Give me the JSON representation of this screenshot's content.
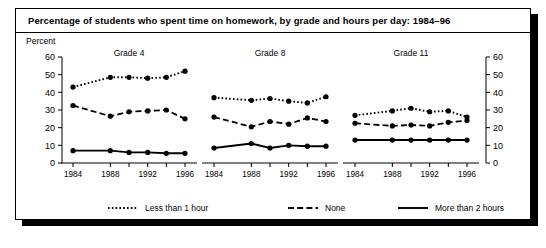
{
  "title": "Percentage of students who spent time on homework, by grade and hours per day: 1984–96",
  "axis_label": "Percent",
  "chart_data": {
    "type": "line",
    "title": "Percentage of students who spent time on homework, by grade and hours per day: 1984–96",
    "ylabel": "Percent",
    "xlabel": "",
    "ylim": [
      0,
      60
    ],
    "yticks": [
      0,
      10,
      20,
      30,
      40,
      50,
      60
    ],
    "grid": false,
    "legend_position": "bottom",
    "x": [
      1984,
      1988,
      1990,
      1992,
      1994,
      1996
    ],
    "xtick_labels": [
      "1984",
      "1988",
      "1992",
      "1996"
    ],
    "xticks_shown": [
      1984,
      1988,
      1992,
      1996
    ],
    "panels": [
      {
        "name": "Grade 4",
        "series": [
          {
            "name": "Less than 1 hour",
            "style": "dotted",
            "values": [
              43,
              48.5,
              48.5,
              48,
              48.5,
              52
            ]
          },
          {
            "name": "None",
            "style": "dashed",
            "values": [
              32.5,
              26.5,
              29,
              29.5,
              30,
              25
            ]
          },
          {
            "name": "More than 2 hours",
            "style": "solid",
            "values": [
              7,
              7,
              6,
              6,
              5.5,
              5.5
            ]
          }
        ]
      },
      {
        "name": "Grade 8",
        "series": [
          {
            "name": "Less than 1 hour",
            "style": "dotted",
            "values": [
              37,
              35.5,
              36.5,
              35,
              34,
              37.5
            ]
          },
          {
            "name": "None",
            "style": "dashed",
            "values": [
              26,
              20.5,
              23.5,
              22,
              25.5,
              23.5
            ]
          },
          {
            "name": "More than 2 hours",
            "style": "solid",
            "values": [
              8.5,
              11,
              8.5,
              10,
              9.5,
              9.5
            ]
          }
        ]
      },
      {
        "name": "Grade 11",
        "series": [
          {
            "name": "Less than 1 hour",
            "style": "dotted",
            "values": [
              27,
              29.5,
              31,
              29,
              29.5,
              26
            ]
          },
          {
            "name": "None",
            "style": "dashed",
            "values": [
              22.5,
              21,
              21.5,
              21,
              23,
              24
            ]
          },
          {
            "name": "More than 2 hours",
            "style": "solid",
            "values": [
              13,
              13,
              13,
              13,
              13,
              13
            ]
          }
        ]
      }
    ],
    "legend": [
      {
        "label": "Less than 1 hour",
        "style": "dotted"
      },
      {
        "label": "None",
        "style": "dashed"
      },
      {
        "label": "More than 2 hours",
        "style": "solid"
      }
    ]
  }
}
